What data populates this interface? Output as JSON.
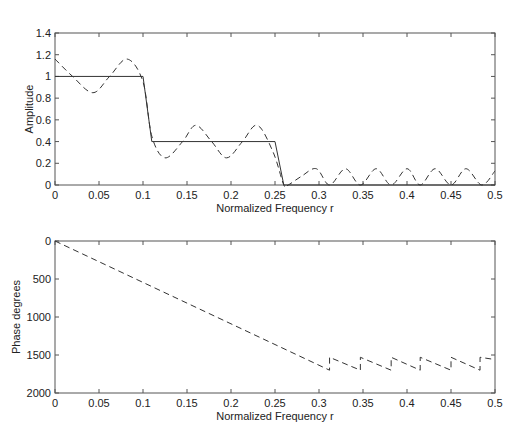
{
  "chart_data": [
    {
      "type": "line",
      "title": "",
      "xlabel": "Normalized Frequency  r",
      "ylabel": "Amplitude",
      "xlim": [
        0,
        0.5
      ],
      "ylim": [
        0,
        1.4
      ],
      "xticks": [
        "0",
        "0.05",
        "0.1",
        "0.15",
        "0.2",
        "0.25",
        "0.3",
        "0.35",
        "0.4",
        "0.45",
        "0.5"
      ],
      "yticks": [
        "0",
        "0.2",
        "0.4",
        "0.6",
        "0.8",
        "1",
        "1.2",
        "1.4"
      ],
      "grid": false,
      "legend": null,
      "series": [
        {
          "name": "Desired response",
          "style": "solid",
          "x": [
            0,
            0.1,
            0.11,
            0.25,
            0.26,
            0.5
          ],
          "y": [
            1,
            1,
            0.4,
            0.4,
            0,
            0
          ]
        },
        {
          "name": "Designed filter response",
          "style": "dashed",
          "x": [
            0,
            0.02,
            0.043,
            0.062,
            0.082,
            0.1,
            0.11,
            0.125,
            0.145,
            0.16,
            0.178,
            0.195,
            0.213,
            0.23,
            0.248,
            0.26,
            0.265,
            0.28,
            0.297,
            0.312,
            0.33,
            0.347,
            0.365,
            0.382,
            0.4,
            0.415,
            0.432,
            0.45,
            0.467,
            0.485,
            0.5
          ],
          "y": [
            1.16,
            1.0,
            0.85,
            1.0,
            1.16,
            0.95,
            0.45,
            0.25,
            0.4,
            0.55,
            0.4,
            0.25,
            0.4,
            0.55,
            0.3,
            0.0,
            0.0,
            0.08,
            0.15,
            0.0,
            0.15,
            0.0,
            0.15,
            0.0,
            0.15,
            0.0,
            0.15,
            0.0,
            0.15,
            0.0,
            0.13
          ]
        }
      ]
    },
    {
      "type": "line",
      "title": "",
      "xlabel": "Normalized Frequency  r",
      "ylabel": "Phase  degrees",
      "xlim": [
        0,
        0.5
      ],
      "ylim": [
        2000,
        0
      ],
      "y_inverted": true,
      "xticks": [
        "0",
        "0.05",
        "0.1",
        "0.15",
        "0.2",
        "0.25",
        "0.3",
        "0.35",
        "0.4",
        "0.45",
        "0.5"
      ],
      "yticks": [
        "0",
        "500",
        "1000",
        "1500",
        "2000"
      ],
      "grid": false,
      "legend": null,
      "series": [
        {
          "name": "Phase",
          "style": "dashed",
          "x": [
            0,
            0.312,
            0.312,
            0.347,
            0.347,
            0.382,
            0.382,
            0.415,
            0.415,
            0.45,
            0.45,
            0.483,
            0.483,
            0.5
          ],
          "y": [
            0,
            1700,
            1530,
            1700,
            1530,
            1700,
            1530,
            1700,
            1530,
            1700,
            1530,
            1700,
            1530,
            1560
          ]
        }
      ]
    }
  ]
}
